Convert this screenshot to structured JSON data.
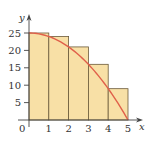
{
  "chart_data": {
    "type": "bar",
    "title": "",
    "xlabel": "x",
    "ylabel": "y",
    "function": "y = 25 - x^2",
    "categories": [
      "[0,1]",
      "[1,2]",
      "[2,3]",
      "[3,4]",
      "[4,5]"
    ],
    "x_left": [
      0,
      1,
      2,
      3,
      4
    ],
    "values": [
      25,
      24,
      21,
      16,
      9
    ],
    "curve": {
      "x": [
        0,
        1,
        2,
        3,
        4,
        5
      ],
      "y": [
        25,
        24,
        21,
        16,
        9,
        0
      ]
    },
    "xlim": [
      0,
      5
    ],
    "ylim": [
      0,
      25
    ],
    "x_ticks": [
      "0",
      "1",
      "2",
      "3",
      "4",
      "5"
    ],
    "y_ticks": [
      "5",
      "10",
      "15",
      "20",
      "25"
    ],
    "grid": false,
    "legend": null
  },
  "axis": {
    "x_label": "x",
    "y_label": "y",
    "origin_label": "0",
    "x_ticks": [
      "1",
      "2",
      "3",
      "4",
      "5"
    ],
    "y_ticks": [
      "5",
      "10",
      "15",
      "20",
      "25"
    ]
  },
  "colors": {
    "bar_fill": "#f8e0a6",
    "bar_stroke": "#6b5a3a",
    "curve": "#e0604a",
    "axis": "#444444"
  }
}
